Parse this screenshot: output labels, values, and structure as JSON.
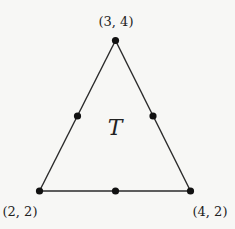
{
  "diagram": {
    "type": "triangle",
    "label": "T",
    "vertices": [
      {
        "name": "top",
        "label": "(3, 4)",
        "x": 115.5,
        "y": 40.5
      },
      {
        "name": "bottom-left",
        "label": "(2, 2)",
        "x": 39.5,
        "y": 191
      },
      {
        "name": "bottom-right",
        "label": "(4, 2)",
        "x": 190.5,
        "y": 191
      }
    ],
    "midpoints": [
      {
        "name": "left-edge-midpoint",
        "x": 77.5,
        "y": 116
      },
      {
        "name": "right-edge-midpoint",
        "x": 153,
        "y": 116
      },
      {
        "name": "bottom-edge-midpoint",
        "x": 115.5,
        "y": 191
      }
    ],
    "colors": {
      "background": "#f7f7f5",
      "stroke": "#2a2a2a",
      "point": "#111111",
      "text": "#222222"
    }
  }
}
